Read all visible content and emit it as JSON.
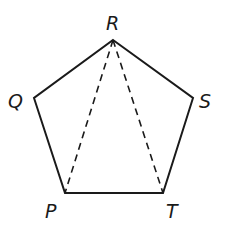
{
  "diagram": {
    "type": "regular-pentagon",
    "stroke_color": "#1a1a1a",
    "vertices": [
      {
        "id": "R",
        "label": "R",
        "x": 113,
        "y": 40
      },
      {
        "id": "S",
        "label": "S",
        "x": 193,
        "y": 98
      },
      {
        "id": "T",
        "label": "T",
        "x": 163,
        "y": 193
      },
      {
        "id": "P",
        "label": "P",
        "x": 65,
        "y": 193
      },
      {
        "id": "Q",
        "label": "Q",
        "x": 34,
        "y": 98
      }
    ],
    "edges": [
      {
        "from": "R",
        "to": "S",
        "style": "solid"
      },
      {
        "from": "S",
        "to": "T",
        "style": "solid"
      },
      {
        "from": "T",
        "to": "P",
        "style": "solid"
      },
      {
        "from": "P",
        "to": "Q",
        "style": "solid"
      },
      {
        "from": "Q",
        "to": "R",
        "style": "solid"
      }
    ],
    "diagonals": [
      {
        "from": "R",
        "to": "P",
        "style": "dashed"
      },
      {
        "from": "R",
        "to": "T",
        "style": "dashed"
      }
    ],
    "labels": {
      "R": "R",
      "Q": "Q",
      "S": "S",
      "P": "P",
      "T": "T"
    }
  }
}
